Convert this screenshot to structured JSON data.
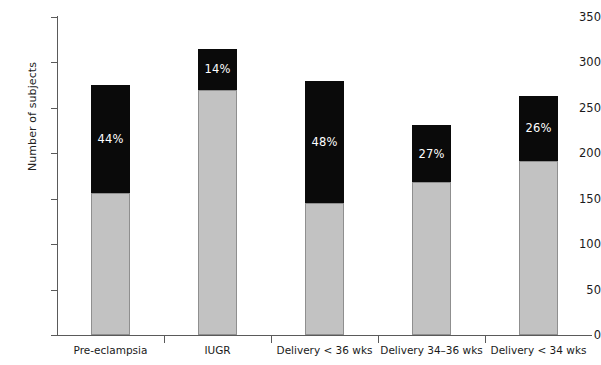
{
  "chart_data": {
    "type": "bar",
    "subtype": "stacked",
    "title": "",
    "xlabel": "",
    "ylabel": "Number of subjects",
    "ylim": [
      0,
      350
    ],
    "ytick_values": [
      0,
      50,
      100,
      150,
      200,
      250,
      300,
      350
    ],
    "ytick_labels": [
      "0",
      "50",
      "100",
      "150",
      "200",
      "250",
      "300",
      "350"
    ],
    "grid": false,
    "legend": null,
    "categories": [
      "Pre-eclampsia",
      "IUGR",
      "Delivery < 36 wks",
      "Delivery 34–36 wks",
      "Delivery < 34 wks"
    ],
    "series": [
      {
        "name": "lower-segment",
        "color": "#c2c2c2",
        "values": [
          156,
          270,
          145,
          168,
          192
        ]
      },
      {
        "name": "upper-segment",
        "color": "#0a0a0a",
        "values": [
          119,
          45,
          135,
          63,
          71
        ]
      }
    ],
    "totals": [
      275,
      315,
      280,
      231,
      263
    ],
    "annotations": [
      {
        "category": "Pre-eclampsia",
        "text": "44%",
        "segment": "upper-segment"
      },
      {
        "category": "IUGR",
        "text": "14%",
        "segment": "upper-segment"
      },
      {
        "category": "Delivery < 36 wks",
        "text": "48%",
        "segment": "upper-segment"
      },
      {
        "category": "Delivery 34–36 wks",
        "text": "27%",
        "segment": "upper-segment"
      },
      {
        "category": "Delivery < 34 wks",
        "text": "26%",
        "segment": "upper-segment"
      }
    ]
  },
  "axes": {
    "y_title": "Number of subjects"
  }
}
